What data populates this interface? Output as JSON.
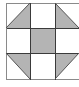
{
  "diagram": {
    "type": "quilt-block-3x3",
    "grid": {
      "rows": 3,
      "cols": 3
    },
    "colors": {
      "fill": "#b4b4b4",
      "line": "#3a3a3a",
      "background": "#ffffff"
    },
    "cells": [
      {
        "row": 0,
        "col": 0,
        "shape": "half-triangle",
        "filled": "bottom-right"
      },
      {
        "row": 0,
        "col": 1,
        "shape": "empty"
      },
      {
        "row": 0,
        "col": 2,
        "shape": "half-triangle",
        "filled": "bottom-left"
      },
      {
        "row": 1,
        "col": 0,
        "shape": "empty"
      },
      {
        "row": 1,
        "col": 1,
        "shape": "full-square"
      },
      {
        "row": 1,
        "col": 2,
        "shape": "empty"
      },
      {
        "row": 2,
        "col": 0,
        "shape": "half-triangle",
        "filled": "top-right"
      },
      {
        "row": 2,
        "col": 1,
        "shape": "empty"
      },
      {
        "row": 2,
        "col": 2,
        "shape": "half-triangle",
        "filled": "top-left"
      }
    ]
  }
}
